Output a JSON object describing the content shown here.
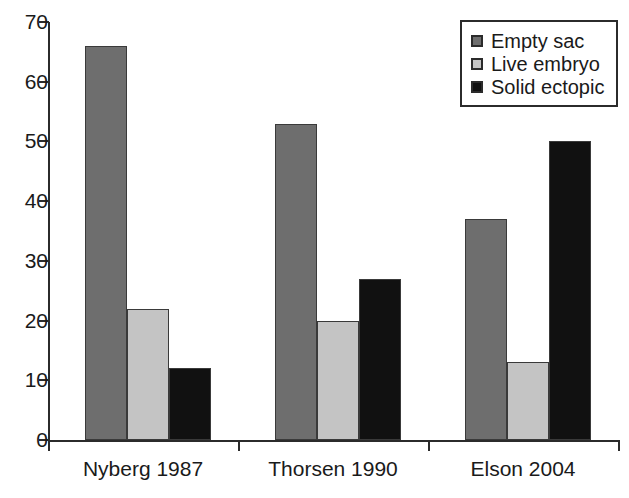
{
  "chart_data": {
    "type": "bar",
    "title": "",
    "xlabel": "",
    "ylabel": "",
    "ylim": [
      0,
      70
    ],
    "yticks": [
      0,
      10,
      20,
      30,
      40,
      50,
      60,
      70
    ],
    "grid": false,
    "legend_position": "top-right",
    "categories": [
      "Nyberg 1987",
      "Thorsen 1990",
      "Elson 2004"
    ],
    "series": [
      {
        "name": "Empty sac",
        "color": "#6e6e6e",
        "values": [
          66,
          53,
          37
        ]
      },
      {
        "name": "Live embryo",
        "color": "#c4c4c4",
        "values": [
          22,
          20,
          13
        ]
      },
      {
        "name": "Solid ectopic",
        "color": "#111111",
        "values": [
          12,
          27,
          50
        ]
      }
    ]
  },
  "legend": {
    "items": [
      {
        "label": "Empty sac"
      },
      {
        "label": "Live embryo"
      },
      {
        "label": "Solid ectopic"
      }
    ]
  },
  "axis": {
    "y_tick_labels": [
      "70",
      "60",
      "50",
      "40",
      "30",
      "20",
      "10",
      "0"
    ],
    "x_tick_labels": [
      "Nyberg 1987",
      "Thorsen 1990",
      "Elson 2004"
    ]
  }
}
